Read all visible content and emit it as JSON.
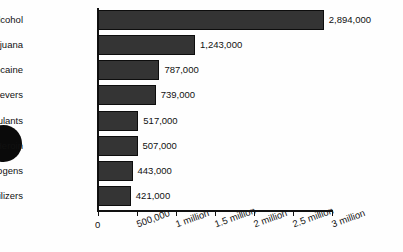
{
  "chart_data": {
    "type": "bar",
    "orientation": "horizontal",
    "title": "",
    "subtitle": "",
    "xlabel": "",
    "ylabel": "",
    "categories": [
      "Alcohol",
      "Marijuana",
      "Cocaine",
      "Pain Relievers",
      "Stimulants",
      "Heroin",
      "Hallucinogens",
      "Tranquilizers"
    ],
    "values": [
      2894000,
      1243000,
      787000,
      739000,
      517000,
      507000,
      443000,
      421000
    ],
    "value_labels": [
      "2,894,000",
      "1,243,000",
      "787,000",
      "739,000",
      "517,000",
      "507,000",
      "443,000",
      "421,000"
    ],
    "xlim": [
      0,
      3000000
    ],
    "xticks": [
      0,
      500000,
      1000000,
      1500000,
      2000000,
      2500000,
      3000000
    ],
    "xtick_labels": [
      "0",
      "500,000",
      "1 million",
      "1.5 million",
      "2 million",
      "2.5 million",
      "3 million"
    ],
    "grid": false,
    "legend": false,
    "bar_color": "#343434",
    "bar_border_color": "#0d0d0d",
    "axis_color": "#111111",
    "background_color": "#fefefe"
  },
  "artifact": {
    "name": "page-hole-punch-mark"
  }
}
